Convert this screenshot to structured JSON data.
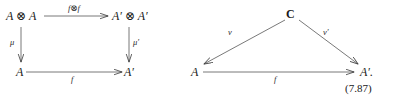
{
  "figure": {
    "equation_number": "(7.87)",
    "background_color": "#ffffff",
    "ink_color": "#1a1a1a"
  },
  "square_diagram": {
    "name": "commutative-square",
    "nodes": {
      "top_left": "A ⊗ A",
      "top_right": "A′ ⊗ A′",
      "bottom_left": "A",
      "bottom_right": "A′"
    },
    "arrow_labels": {
      "top": "f⊗f",
      "left": "μ",
      "right": "μ′",
      "bottom": "f"
    }
  },
  "triangle_diagram": {
    "name": "commutative-triangle",
    "nodes": {
      "apex": "C",
      "bottom_left": "A",
      "bottom_right": "A′."
    },
    "arrow_labels": {
      "left": "v",
      "right": "v′",
      "bottom": "f"
    }
  }
}
